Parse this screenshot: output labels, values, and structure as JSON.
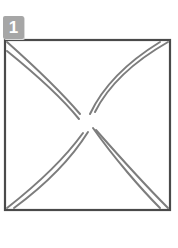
{
  "figure": {
    "background_color": "#ffffff",
    "badge": {
      "label": "1",
      "background_color": "#a6a6a6",
      "text_color": "#ffffff",
      "shadow_color": "#d9d9d9",
      "icon_name": "index-badge"
    },
    "frame": {
      "name": "square-outline",
      "stroke_color": "#4a4a4a",
      "stroke_width": 2.2,
      "fill": "none",
      "left": 5,
      "top": 40,
      "right": 170,
      "bottom": 210
    },
    "strokes": {
      "stroke_color": "#7d7d7d",
      "stroke_width": 2.0,
      "description": "Four curved double-line strands sweeping from each corner of the square toward a pinched bowtie junction near the center.",
      "center": {
        "x": 88,
        "y": 122
      },
      "paths": [
        {
          "name": "corner-stroke-top-left-outer",
          "corner": "top-left",
          "d": "M 7 42 C 34 66 62 93 80 114"
        },
        {
          "name": "corner-stroke-top-left-inner",
          "corner": "top-left",
          "d": "M 7 51 C 33 72 62 98 79 119"
        },
        {
          "name": "corner-stroke-top-right-outer",
          "corner": "top-right",
          "d": "M 168 42 C 140 58 110 82 95 112"
        },
        {
          "name": "corner-stroke-top-right-inner",
          "corner": "top-right",
          "d": "M 160 42 C 134 58 105 82 90 114"
        },
        {
          "name": "corner-stroke-bottom-left-outer",
          "corner": "bottom-left",
          "d": "M 7 208 C 30 190 62 162 83 133"
        },
        {
          "name": "corner-stroke-bottom-left-inner",
          "corner": "bottom-left",
          "d": "M 14 208 C 37 191 68 164 88 132"
        },
        {
          "name": "corner-stroke-bottom-right-outer",
          "corner": "bottom-right",
          "d": "M 168 208 C 148 188 118 155 96 130"
        },
        {
          "name": "corner-stroke-bottom-right-inner",
          "corner": "bottom-right",
          "d": "M 160 208 C 142 190 114 158 93 128"
        }
      ]
    }
  }
}
